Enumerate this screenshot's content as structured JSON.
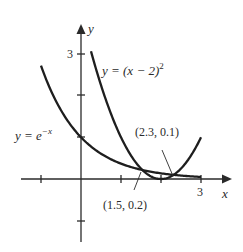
{
  "chart_data": {
    "type": "line",
    "title": "",
    "xlabel": "x",
    "ylabel": "y",
    "xlim": [
      -2,
      3.6
    ],
    "ylim": [
      -1.6,
      3.6
    ],
    "x_ticks": [
      -1,
      1,
      2,
      3
    ],
    "x_tick_labels": [
      "",
      "",
      "",
      "3"
    ],
    "y_ticks": [
      -1,
      1,
      2,
      3
    ],
    "y_tick_labels": [
      "",
      "",
      "",
      "3"
    ],
    "grid": false,
    "series": [
      {
        "name": "y = e^{-x}",
        "expression": "exp(-x)",
        "x_range": [
          -1.0,
          3.0
        ]
      },
      {
        "name": "y = (x - 2)^2",
        "expression": "(x-2)^2",
        "x_range": [
          0.25,
          3.0
        ]
      }
    ],
    "annotations": [
      {
        "text": "(1.5, 0.2)",
        "point": [
          1.5,
          0.2
        ]
      },
      {
        "text": "(2.3, 0.1)",
        "point": [
          2.3,
          0.1
        ]
      }
    ]
  },
  "labels": {
    "x_axis": "x",
    "y_axis": "y",
    "y_tick_3": "3",
    "x_tick_3": "3",
    "curve1_prefix": "y = e",
    "curve1_exp": "−x",
    "curve2_main": "y = (x − 2)",
    "curve2_exp": "2",
    "point1": "(1.5, 0.2)",
    "point2": "(2.3, 0.1)"
  }
}
